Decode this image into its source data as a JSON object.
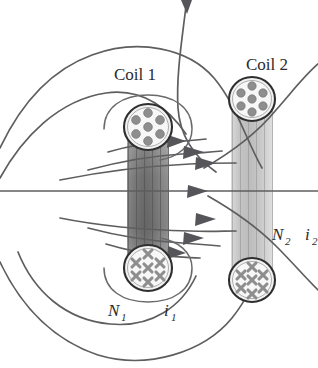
{
  "figure": {
    "background_color": "#ffffff",
    "width": 318,
    "height": 368
  },
  "labels": {
    "coil1": "Coil 1",
    "coil2": "Coil 2",
    "n1_symbol": "N",
    "n1_subscript": "1",
    "i1_symbol": "i",
    "i1_subscript": "1",
    "n2_symbol": "N",
    "n2_subscript": "2",
    "i2_symbol": "i",
    "i2_subscript": "2"
  },
  "colors": {
    "field_line": "#5e5e60",
    "arrowhead": "#56565a",
    "coil_outline": "#2f2f2f",
    "wire_marker": "#8e8e8e",
    "solenoid_dark": "#6f6f6f",
    "solenoid_light": "#c9c9c9",
    "text": "#2b2b2b"
  },
  "coils": [
    {
      "name": "coil-1",
      "label": "Coil 1",
      "turns_symbol": "N",
      "turns_subscript": "1",
      "current_symbol": "i",
      "current_subscript": "1",
      "top_cross_section": "dots-out-of-page",
      "bottom_cross_section": "crosses-into-page",
      "wire_count_visible": 7,
      "shading": "dark"
    },
    {
      "name": "coil-2",
      "label": "Coil 2",
      "turns_symbol": "N",
      "turns_subscript": "2",
      "current_symbol": "i",
      "current_subscript": "2",
      "top_cross_section": "dots-out-of-page",
      "bottom_cross_section": "crosses-into-page",
      "wire_count_visible": 7,
      "shading": "light"
    }
  ],
  "field_lines": {
    "count": 9,
    "direction": "left-to-right through coil interiors",
    "arrow_count": 7,
    "description": "Magnetic flux lines emerging from coil 1 and linking coil 2"
  },
  "icons": {
    "current_out_of_page": "dot-icon",
    "current_into_page": "cross-icon",
    "flux_direction": "arrow-right-icon"
  }
}
